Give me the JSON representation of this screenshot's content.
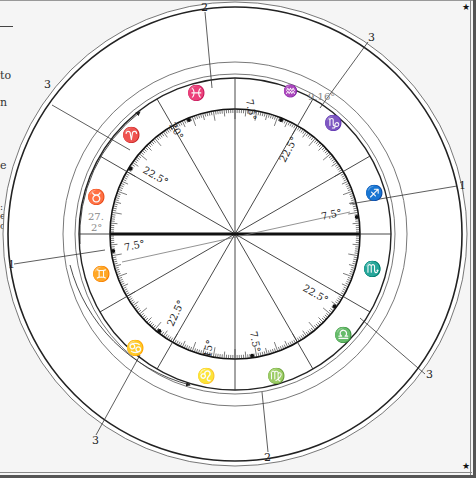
{
  "page": {
    "side_text_fragments": [
      "to",
      "n",
      "e",
      ":",
      "e",
      "o"
    ],
    "corner_marks": [
      "★",
      "★"
    ]
  },
  "chart": {
    "center": [
      235,
      234
    ],
    "zodiac_signs": [
      {
        "name": "Pisces",
        "glyph": "♓",
        "angle_deg": 105
      },
      {
        "name": "Aquarius",
        "glyph": "♒",
        "angle_deg": 75
      },
      {
        "name": "Capricorn",
        "glyph": "♑",
        "angle_deg": 45
      },
      {
        "name": "Sagittarius",
        "glyph": "♐",
        "angle_deg": 15
      },
      {
        "name": "Scorpio",
        "glyph": "♏",
        "angle_deg": -15
      },
      {
        "name": "Libra",
        "glyph": "♎",
        "angle_deg": -45
      },
      {
        "name": "Virgo",
        "glyph": "♍",
        "angle_deg": -75
      },
      {
        "name": "Leo",
        "glyph": "♌",
        "angle_deg": -105
      },
      {
        "name": "Cancer",
        "glyph": "♋",
        "angle_deg": -135
      },
      {
        "name": "Gemini",
        "glyph": "♊",
        "angle_deg": -165
      },
      {
        "name": "Taurus",
        "glyph": "♉",
        "angle_deg": 165
      },
      {
        "name": "Aries",
        "glyph": "♈",
        "angle_deg": 135
      }
    ],
    "sign_annotations": {
      "aquarius_degree": "9.16°",
      "taurus_degree_line1": "27.",
      "taurus_degree_line2": "2°"
    },
    "angle_labels": [
      {
        "text": "20°",
        "note": "near Aries"
      },
      {
        "text": "7.5°",
        "note": "top right of vertical"
      },
      {
        "text": "22.5°",
        "note": "upper left"
      },
      {
        "text": "22.5°",
        "note": "upper right"
      },
      {
        "text": "7.5°",
        "note": "right"
      },
      {
        "text": "7.5°",
        "note": "left"
      },
      {
        "text": "22.5°",
        "note": "lower right"
      },
      {
        "text": "22.5°",
        "note": "lower left"
      },
      {
        "text": "15°",
        "note": "bottom near Leo"
      },
      {
        "text": "7.5°",
        "note": "bottom right of vertical"
      }
    ],
    "callouts": [
      {
        "label": "2",
        "position": "top"
      },
      {
        "label": "3",
        "position": "top-right"
      },
      {
        "label": "3",
        "position": "top-left"
      },
      {
        "label": "1",
        "position": "right"
      },
      {
        "label": "1",
        "position": "left"
      },
      {
        "label": "3",
        "position": "bottom-right"
      },
      {
        "label": "3",
        "position": "bottom-left"
      },
      {
        "label": "2",
        "position": "bottom"
      }
    ],
    "colors": {
      "line": "#222222",
      "light_line": "#777777",
      "gray_text": "#888888",
      "background": "#ffffff",
      "page": "#f5f5f5"
    }
  }
}
